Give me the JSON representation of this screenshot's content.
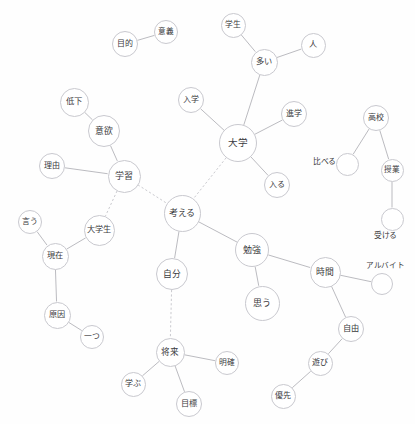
{
  "diagram": {
    "type": "co-occurrence-network",
    "title": "",
    "width": 415,
    "height": 424,
    "background_color": "#fefefe",
    "node_stroke_color": "#c9c9cf",
    "node_fill_color": "#ffffff",
    "edge_solid_color": "#a9a9b0",
    "edge_dashed_color": "#c4c4ca",
    "label_color": "#3b3b40"
  },
  "nodes": [
    {
      "id": "mokuteki",
      "label": "目的",
      "x": 125,
      "y": 44,
      "r": 13.0,
      "font": 8.0,
      "label_outside": false
    },
    {
      "id": "igi",
      "label": "意義",
      "x": 166,
      "y": 32,
      "r": 12.0,
      "font": 7.6,
      "label_outside": false
    },
    {
      "id": "gakusei",
      "label": "学生",
      "x": 233,
      "y": 25,
      "r": 12.5,
      "font": 7.8,
      "label_outside": false
    },
    {
      "id": "hito",
      "label": "人",
      "x": 313,
      "y": 45,
      "r": 12.5,
      "font": 8.2,
      "label_outside": false
    },
    {
      "id": "ooi",
      "label": "多い",
      "x": 264,
      "y": 62,
      "r": 13.5,
      "font": 8.2,
      "label_outside": false
    },
    {
      "id": "teika",
      "label": "低下",
      "x": 74,
      "y": 102,
      "r": 14.5,
      "font": 8.4,
      "label_outside": false
    },
    {
      "id": "nyugaku",
      "label": "入学",
      "x": 191,
      "y": 100,
      "r": 13.0,
      "font": 8.0,
      "label_outside": false
    },
    {
      "id": "shingaku",
      "label": "進学",
      "x": 294,
      "y": 114,
      "r": 13.0,
      "font": 8.0,
      "label_outside": false
    },
    {
      "id": "koukou",
      "label": "高校",
      "x": 376,
      "y": 118,
      "r": 13.0,
      "font": 8.0,
      "label_outside": false
    },
    {
      "id": "iyoku",
      "label": "意欲",
      "x": 104,
      "y": 131,
      "r": 16.0,
      "font": 8.8,
      "label_outside": false
    },
    {
      "id": "daigaku",
      "label": "大学",
      "x": 238,
      "y": 143,
      "r": 19.0,
      "font": 9.6,
      "label_outside": false
    },
    {
      "id": "riyu",
      "label": "理由",
      "x": 52,
      "y": 166,
      "r": 13.0,
      "font": 8.0,
      "label_outside": false
    },
    {
      "id": "kuraberu",
      "label": "比べる",
      "x": 347,
      "y": 164,
      "r": 11.5,
      "font": 7.8,
      "label_outside": true,
      "label_dx": -34,
      "label_dy": -2
    },
    {
      "id": "jugyou",
      "label": "授業",
      "x": 392,
      "y": 170,
      "r": 11.5,
      "font": 7.6,
      "label_outside": false
    },
    {
      "id": "gakushuu",
      "label": "学習",
      "x": 124,
      "y": 176,
      "r": 16.5,
      "font": 9.0,
      "label_outside": false
    },
    {
      "id": "hairu",
      "label": "入る",
      "x": 277,
      "y": 185,
      "r": 13.0,
      "font": 8.0,
      "label_outside": false
    },
    {
      "id": "kangaeru",
      "label": "考える",
      "x": 182,
      "y": 213,
      "r": 18.5,
      "font": 9.0,
      "label_outside": false
    },
    {
      "id": "ukeru",
      "label": "受ける",
      "x": 392,
      "y": 219,
      "r": 11.5,
      "font": 7.8,
      "label_outside": true,
      "label_dx": -18,
      "label_dy": 17
    },
    {
      "id": "iu",
      "label": "言う",
      "x": 30,
      "y": 222,
      "r": 12.0,
      "font": 7.8,
      "label_outside": false
    },
    {
      "id": "daigakusei",
      "label": "大学生",
      "x": 99,
      "y": 230,
      "r": 15.5,
      "font": 8.2,
      "label_outside": false
    },
    {
      "id": "benkyou",
      "label": "勉強",
      "x": 252,
      "y": 250,
      "r": 17.0,
      "font": 9.0,
      "label_outside": false
    },
    {
      "id": "genzai",
      "label": "現在",
      "x": 55,
      "y": 256,
      "r": 13.5,
      "font": 8.2,
      "label_outside": false
    },
    {
      "id": "jikan",
      "label": "時間",
      "x": 325,
      "y": 272,
      "r": 15.5,
      "font": 8.8,
      "label_outside": false
    },
    {
      "id": "arubaito",
      "label": "アルバイト",
      "x": 382,
      "y": 284,
      "r": 11.0,
      "font": 7.6,
      "label_outside": true,
      "label_dx": -16,
      "label_dy": -18
    },
    {
      "id": "jibun",
      "label": "自分",
      "x": 172,
      "y": 274,
      "r": 16.0,
      "font": 8.8,
      "label_outside": false
    },
    {
      "id": "omou",
      "label": "思う",
      "x": 262,
      "y": 303,
      "r": 17.5,
      "font": 9.0,
      "label_outside": false
    },
    {
      "id": "gen-in",
      "label": "原因",
      "x": 57,
      "y": 315,
      "r": 13.5,
      "font": 8.2,
      "label_outside": false
    },
    {
      "id": "jiyuu",
      "label": "自由",
      "x": 351,
      "y": 329,
      "r": 13.0,
      "font": 8.2,
      "label_outside": false
    },
    {
      "id": "hitotsu",
      "label": "一つ",
      "x": 92,
      "y": 337,
      "r": 12.0,
      "font": 7.8,
      "label_outside": false
    },
    {
      "id": "shourai",
      "label": "将来",
      "x": 170,
      "y": 352,
      "r": 14.5,
      "font": 8.6,
      "label_outside": false
    },
    {
      "id": "asobi",
      "label": "遊び",
      "x": 320,
      "y": 363,
      "r": 12.5,
      "font": 8.0,
      "label_outside": false
    },
    {
      "id": "meikaku",
      "label": "明確",
      "x": 227,
      "y": 363,
      "r": 12.0,
      "font": 7.8,
      "label_outside": false
    },
    {
      "id": "manabu",
      "label": "学ぶ",
      "x": 133,
      "y": 384,
      "r": 12.5,
      "font": 8.0,
      "label_outside": false
    },
    {
      "id": "mokuhyou",
      "label": "目標",
      "x": 189,
      "y": 404,
      "r": 13.0,
      "font": 8.2,
      "label_outside": false
    },
    {
      "id": "yuusen",
      "label": "優先",
      "x": 283,
      "y": 396,
      "r": 12.5,
      "font": 8.0,
      "label_outside": false
    }
  ],
  "edges": [
    {
      "source": "mokuteki",
      "target": "igi",
      "style": "solid"
    },
    {
      "source": "gakusei",
      "target": "ooi",
      "style": "solid"
    },
    {
      "source": "ooi",
      "target": "hito",
      "style": "solid"
    },
    {
      "source": "ooi",
      "target": "daigaku",
      "style": "solid"
    },
    {
      "source": "teika",
      "target": "iyoku",
      "style": "solid"
    },
    {
      "source": "iyoku",
      "target": "gakushuu",
      "style": "solid"
    },
    {
      "source": "riyu",
      "target": "gakushuu",
      "style": "solid"
    },
    {
      "source": "nyugaku",
      "target": "daigaku",
      "style": "solid"
    },
    {
      "source": "daigaku",
      "target": "shingaku",
      "style": "solid"
    },
    {
      "source": "daigaku",
      "target": "hairu",
      "style": "solid"
    },
    {
      "source": "daigaku",
      "target": "kangaeru",
      "style": "dashed"
    },
    {
      "source": "gakushuu",
      "target": "kangaeru",
      "style": "dashed"
    },
    {
      "source": "gakushuu",
      "target": "daigakusei",
      "style": "dashed"
    },
    {
      "source": "koukou",
      "target": "kuraberu",
      "style": "solid"
    },
    {
      "source": "koukou",
      "target": "jugyou",
      "style": "solid"
    },
    {
      "source": "jugyou",
      "target": "ukeru",
      "style": "solid"
    },
    {
      "source": "kangaeru",
      "target": "jibun",
      "style": "solid"
    },
    {
      "source": "kangaeru",
      "target": "benkyou",
      "style": "solid"
    },
    {
      "source": "benkyou",
      "target": "omou",
      "style": "solid"
    },
    {
      "source": "benkyou",
      "target": "jikan",
      "style": "solid"
    },
    {
      "source": "jikan",
      "target": "arubaito",
      "style": "solid"
    },
    {
      "source": "jikan",
      "target": "jiyuu",
      "style": "solid"
    },
    {
      "source": "jiyuu",
      "target": "asobi",
      "style": "solid"
    },
    {
      "source": "asobi",
      "target": "yuusen",
      "style": "solid"
    },
    {
      "source": "iu",
      "target": "genzai",
      "style": "solid"
    },
    {
      "source": "daigakusei",
      "target": "genzai",
      "style": "solid"
    },
    {
      "source": "genzai",
      "target": "gen-in",
      "style": "solid"
    },
    {
      "source": "gen-in",
      "target": "hitotsu",
      "style": "solid"
    },
    {
      "source": "jibun",
      "target": "shourai",
      "style": "dashed"
    },
    {
      "source": "shourai",
      "target": "manabu",
      "style": "solid"
    },
    {
      "source": "shourai",
      "target": "mokuhyou",
      "style": "solid"
    },
    {
      "source": "shourai",
      "target": "meikaku",
      "style": "solid"
    }
  ]
}
